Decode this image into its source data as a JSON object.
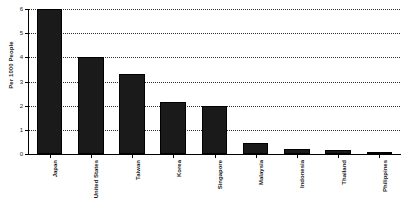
{
  "chart_data": {
    "type": "bar",
    "title": "",
    "subtitle": "",
    "xlabel": "",
    "ylabel": "Per 1000 People",
    "ylim": [
      0,
      6
    ],
    "yticks": [
      0,
      1,
      2,
      3,
      4,
      5,
      6
    ],
    "ytick_labels": [
      "0",
      "1",
      "2",
      "3",
      "4",
      "5",
      "6"
    ],
    "grid": true,
    "grid_axis": "y",
    "grid_style": "dotted",
    "legend": false,
    "legend_position": "none",
    "bar_color": "#1a1a1a",
    "categories": [
      "Japan",
      "United States",
      "Taiwan",
      "Korea",
      "Singapore",
      "Malaysia",
      "Indonesia",
      "Thailand",
      "Philippines"
    ],
    "values": [
      6.0,
      4.0,
      3.3,
      2.15,
      2.0,
      0.45,
      0.2,
      0.17,
      0.1
    ]
  }
}
